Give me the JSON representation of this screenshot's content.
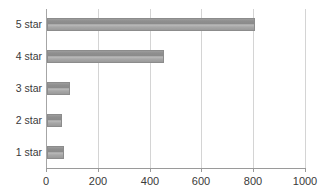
{
  "chart_data": {
    "type": "bar",
    "orientation": "horizontal",
    "title": "",
    "xlabel": "",
    "ylabel": "",
    "categories": [
      "5 star",
      "4 star",
      "3 star",
      "2 star",
      "1 star"
    ],
    "values": [
      805,
      450,
      90,
      57,
      64
    ],
    "xlim": [
      0,
      1000
    ],
    "xticks": [
      0,
      200,
      400,
      600,
      800,
      1000
    ],
    "xtick_labels": [
      "0",
      "200",
      "400",
      "600",
      "800",
      "1000"
    ],
    "grid": "vertical",
    "legend": "none",
    "series": [
      {
        "name": "Reviews",
        "values": [
          805,
          450,
          90,
          57,
          64
        ]
      }
    ],
    "colors": {
      "bar_fill_dark": "#8a8a8a",
      "bar_fill_light": "#bdbdbd",
      "bar_border": "#8c8c8c",
      "gridline": "#d4d4d4",
      "axis": "#9a9a9a",
      "text": "#3a3a3a",
      "background": "#ffffff"
    }
  },
  "clipped_title": {
    "text": ""
  }
}
